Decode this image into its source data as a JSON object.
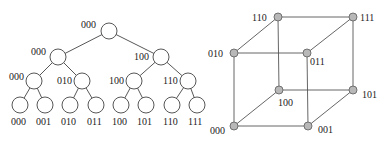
{
  "tree": {
    "stroke": "#444444",
    "node_fill": "#ffffff",
    "radius": 8,
    "nodes": [
      {
        "id": "root",
        "x": 109,
        "y": 31,
        "label": "000",
        "lx": 81,
        "ly": 28
      },
      {
        "id": "l2a",
        "x": 58,
        "y": 57,
        "label": "000",
        "lx": 31,
        "ly": 55
      },
      {
        "id": "l2b",
        "x": 161,
        "y": 57,
        "label": "100",
        "lx": 134,
        "ly": 60
      },
      {
        "id": "l3a",
        "x": 34,
        "y": 81,
        "label": "000",
        "lx": 9,
        "ly": 80
      },
      {
        "id": "l3b",
        "x": 82,
        "y": 81,
        "label": "010",
        "lx": 57,
        "ly": 84
      },
      {
        "id": "l3c",
        "x": 134,
        "y": 81,
        "label": "100",
        "lx": 109,
        "ly": 84
      },
      {
        "id": "l3d",
        "x": 188,
        "y": 81,
        "label": "110",
        "lx": 163,
        "ly": 84
      },
      {
        "id": "lf0",
        "x": 20,
        "y": 105,
        "label": "000",
        "lx": 11,
        "ly": 125
      },
      {
        "id": "lf1",
        "x": 45,
        "y": 105,
        "label": "001",
        "lx": 36,
        "ly": 125
      },
      {
        "id": "lf2",
        "x": 70,
        "y": 105,
        "label": "010",
        "lx": 61,
        "ly": 125
      },
      {
        "id": "lf3",
        "x": 96,
        "y": 105,
        "label": "011",
        "lx": 87,
        "ly": 125
      },
      {
        "id": "lf4",
        "x": 121,
        "y": 105,
        "label": "100",
        "lx": 112,
        "ly": 125
      },
      {
        "id": "lf5",
        "x": 146,
        "y": 105,
        "label": "101",
        "lx": 137,
        "ly": 125
      },
      {
        "id": "lf6",
        "x": 172,
        "y": 105,
        "label": "110",
        "lx": 163,
        "ly": 125
      },
      {
        "id": "lf7",
        "x": 197,
        "y": 105,
        "label": "111",
        "lx": 188,
        "ly": 125
      }
    ],
    "edges": [
      [
        "root",
        "l2a"
      ],
      [
        "root",
        "l2b"
      ],
      [
        "l2a",
        "l3a"
      ],
      [
        "l2a",
        "l3b"
      ],
      [
        "l2b",
        "l3c"
      ],
      [
        "l2b",
        "l3d"
      ],
      [
        "l3a",
        "lf0"
      ],
      [
        "l3a",
        "lf1"
      ],
      [
        "l3b",
        "lf2"
      ],
      [
        "l3b",
        "lf3"
      ],
      [
        "l3c",
        "lf4"
      ],
      [
        "l3c",
        "lf5"
      ],
      [
        "l3d",
        "lf6"
      ],
      [
        "l3d",
        "lf7"
      ]
    ]
  },
  "cube": {
    "stroke": "#555555",
    "node_fill": "#b8b8b8",
    "node_stroke": "#666666",
    "radius": 4,
    "nodes": [
      {
        "id": "110",
        "x": 278,
        "y": 17,
        "label": "110",
        "lx": 252,
        "ly": 21
      },
      {
        "id": "111",
        "x": 353,
        "y": 17,
        "label": "111",
        "lx": 360,
        "ly": 21
      },
      {
        "id": "010",
        "x": 234,
        "y": 53,
        "label": "010",
        "lx": 208,
        "ly": 57
      },
      {
        "id": "011",
        "x": 307,
        "y": 53,
        "label": "011",
        "lx": 310,
        "ly": 65
      },
      {
        "id": "100",
        "x": 279,
        "y": 90,
        "label": "100",
        "lx": 278,
        "ly": 106
      },
      {
        "id": "101",
        "x": 353,
        "y": 90,
        "label": "101",
        "lx": 362,
        "ly": 98
      },
      {
        "id": "000",
        "x": 234,
        "y": 126,
        "label": "000",
        "lx": 210,
        "ly": 134
      },
      {
        "id": "001",
        "x": 308,
        "y": 126,
        "label": "001",
        "lx": 318,
        "ly": 133
      }
    ],
    "edges": [
      [
        "110",
        "111"
      ],
      [
        "010",
        "011"
      ],
      [
        "100",
        "101"
      ],
      [
        "000",
        "001"
      ],
      [
        "110",
        "100"
      ],
      [
        "111",
        "101"
      ],
      [
        "010",
        "000"
      ],
      [
        "011",
        "001"
      ],
      [
        "110",
        "010"
      ],
      [
        "111",
        "011"
      ],
      [
        "100",
        "000"
      ],
      [
        "101",
        "001"
      ]
    ]
  }
}
